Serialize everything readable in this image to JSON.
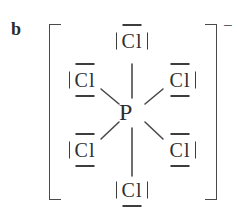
{
  "figure": {
    "part_label": "b",
    "species": "PCl6",
    "charge_label": "−",
    "bracket_left": "[",
    "bracket_right": "]",
    "center_atom": {
      "symbol": "P"
    },
    "ligands": [
      {
        "id": "cl-top",
        "symbol": "Cl",
        "position": "top",
        "lone_pair_marks": [
          "top",
          "left",
          "right"
        ]
      },
      {
        "id": "cl-ul",
        "symbol": "Cl",
        "position": "upper-left",
        "lone_pair_marks": [
          "top",
          "bottom",
          "left"
        ]
      },
      {
        "id": "cl-ur",
        "symbol": "Cl",
        "position": "upper-right",
        "lone_pair_marks": [
          "top",
          "bottom",
          "right"
        ]
      },
      {
        "id": "cl-ll",
        "symbol": "Cl",
        "position": "lower-left",
        "lone_pair_marks": [
          "top",
          "bottom",
          "left"
        ]
      },
      {
        "id": "cl-lr",
        "symbol": "Cl",
        "position": "lower-right",
        "lone_pair_marks": [
          "top",
          "bottom",
          "right"
        ]
      },
      {
        "id": "cl-bottom",
        "symbol": "Cl",
        "position": "bottom",
        "lone_pair_marks": [
          "bottom",
          "left",
          "right"
        ]
      }
    ],
    "bonds": [
      {
        "from": "P",
        "to": "cl-top",
        "order": 1
      },
      {
        "from": "P",
        "to": "cl-ul",
        "order": 1
      },
      {
        "from": "P",
        "to": "cl-ur",
        "order": 1
      },
      {
        "from": "P",
        "to": "cl-ll",
        "order": 1
      },
      {
        "from": "P",
        "to": "cl-lr",
        "order": 1
      },
      {
        "from": "P",
        "to": "cl-bottom",
        "order": 1
      }
    ],
    "colors": {
      "background": "#ffffff",
      "ink": "#2e2e2e",
      "bond": "#4a4a4a",
      "bracket": "#4a4a4a"
    }
  }
}
